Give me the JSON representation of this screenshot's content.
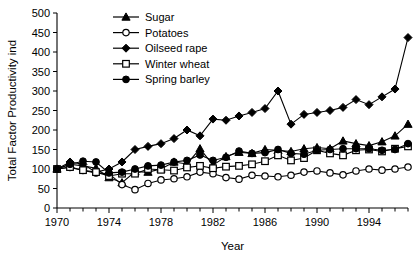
{
  "chart_data": {
    "type": "line",
    "title": "",
    "xlabel": "Year",
    "ylabel": "Total Factor Productivity ind",
    "xlim": [
      1970,
      1997
    ],
    "ylim": [
      0,
      500
    ],
    "yticks": [
      0,
      50,
      100,
      150,
      200,
      250,
      300,
      350,
      400,
      450,
      500
    ],
    "xticks_major": [
      1970,
      1974,
      1978,
      1982,
      1986,
      1990,
      1994
    ],
    "xticks_minor_step": 1,
    "grid": false,
    "legend_position": "top-center",
    "x": [
      1970,
      1971,
      1972,
      1973,
      1974,
      1975,
      1976,
      1977,
      1978,
      1979,
      1980,
      1981,
      1982,
      1983,
      1984,
      1985,
      1986,
      1987,
      1988,
      1989,
      1990,
      1991,
      1992,
      1993,
      1994,
      1995,
      1996,
      1997
    ],
    "series": [
      {
        "name": "Sugar",
        "marker": "filled-triangle",
        "color": "#000000",
        "values": [
          100,
          112,
          108,
          102,
          78,
          65,
          93,
          92,
          100,
          118,
          113,
          152,
          110,
          132,
          143,
          140,
          150,
          148,
          145,
          152,
          155,
          152,
          172,
          165,
          160,
          170,
          185,
          215
        ]
      },
      {
        "name": "Potatoes",
        "marker": "open-circle",
        "color": "#000000",
        "values": [
          100,
          104,
          96,
          90,
          88,
          60,
          47,
          63,
          72,
          75,
          80,
          92,
          88,
          78,
          74,
          84,
          82,
          80,
          84,
          92,
          95,
          90,
          85,
          95,
          100,
          97,
          100,
          105
        ]
      },
      {
        "name": "Oilseed rape",
        "marker": "filled-diamond",
        "color": "#000000",
        "values": [
          100,
          118,
          112,
          92,
          100,
          118,
          150,
          158,
          165,
          178,
          200,
          185,
          228,
          225,
          236,
          245,
          255,
          300,
          215,
          240,
          245,
          250,
          258,
          278,
          265,
          285,
          305,
          437
        ]
      },
      {
        "name": "Winter wheat",
        "marker": "open-square",
        "color": "#000000",
        "values": [
          100,
          105,
          97,
          92,
          82,
          88,
          88,
          100,
          98,
          96,
          104,
          108,
          102,
          106,
          108,
          112,
          120,
          135,
          122,
          128,
          148,
          140,
          135,
          148,
          150,
          145,
          152,
          158
        ]
      },
      {
        "name": "Spring barley",
        "marker": "filled-circle",
        "color": "#000000",
        "values": [
          100,
          112,
          120,
          118,
          90,
          92,
          100,
          108,
          110,
          118,
          122,
          136,
          122,
          130,
          146,
          140,
          142,
          150,
          140,
          138,
          148,
          150,
          152,
          152,
          152,
          148,
          150,
          165
        ]
      }
    ]
  },
  "axis": {
    "ylabel": "Total Factor Productivity ind",
    "xlabel": "Year",
    "ytick_labels": [
      "500",
      "450",
      "400",
      "350",
      "300",
      "250",
      "200",
      "150",
      "100",
      "50",
      "0"
    ],
    "xtick_labels": [
      "1970",
      "1974",
      "1978",
      "1982",
      "1986",
      "1990",
      "1994"
    ]
  },
  "legend": {
    "items": [
      {
        "label": "Sugar",
        "marker": "filled-triangle"
      },
      {
        "label": "Potatoes",
        "marker": "open-circle"
      },
      {
        "label": "Oilseed rape",
        "marker": "filled-diamond"
      },
      {
        "label": "Winter wheat",
        "marker": "open-square"
      },
      {
        "label": "Spring barley",
        "marker": "filled-circle"
      }
    ]
  }
}
